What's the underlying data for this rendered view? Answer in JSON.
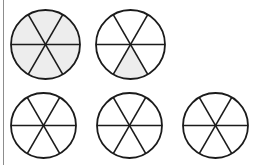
{
  "worksheet": {
    "title": "Fraction circles shading worksheet",
    "background_color": "#ffffff",
    "rule_color": "#8d8d8d",
    "line_color": "#1b1b1b",
    "shade_color": "#ededed",
    "sectors_per_circle": 6,
    "circle_count": 5
  },
  "chart_data": {
    "type": "pie",
    "xlabel": "",
    "ylabel": "",
    "legend": "none",
    "grid": false,
    "sectors_per_circle": 6,
    "slice_value": 0.1667,
    "categories": [
      "circle-1",
      "circle-2",
      "circle-3",
      "circle-4",
      "circle-5"
    ],
    "values": [
      6,
      1,
      0,
      0,
      0
    ],
    "fractions": [
      "6/6",
      "1/6",
      "0/6",
      "0/6",
      "0/6"
    ],
    "series": [
      {
        "name": "shaded sectors",
        "values": [
          6,
          1,
          0,
          0,
          0
        ]
      },
      {
        "name": "unshaded sectors",
        "values": [
          0,
          5,
          6,
          6,
          6
        ]
      }
    ]
  },
  "circles": [
    {
      "name": "circle-1",
      "row": 1,
      "column": 1,
      "cx": 45.5,
      "cy": 44.5,
      "r": 34.5,
      "shaded_sectors": [
        0,
        1,
        2,
        3,
        4,
        5
      ],
      "shaded_count": 6,
      "fraction": "6/6"
    },
    {
      "name": "circle-2",
      "row": 1,
      "column": 2,
      "cx": 130.5,
      "cy": 44.5,
      "r": 34.5,
      "shaded_sectors": [
        4
      ],
      "shaded_count": 1,
      "fraction": "1/6"
    },
    {
      "name": "circle-3",
      "row": 2,
      "column": 1,
      "cx": 43.5,
      "cy": 125.5,
      "r": 32.5,
      "shaded_sectors": [],
      "shaded_count": 0,
      "fraction": "0/6"
    },
    {
      "name": "circle-4",
      "row": 2,
      "column": 2,
      "cx": 129.5,
      "cy": 125.5,
      "r": 32.5,
      "shaded_sectors": [],
      "shaded_count": 0,
      "fraction": "0/6"
    },
    {
      "name": "circle-5",
      "row": 2,
      "column": 3,
      "cx": 215.5,
      "cy": 125.5,
      "r": 32.5,
      "shaded_sectors": [],
      "shaded_count": 0,
      "fraction": "0/6"
    }
  ]
}
